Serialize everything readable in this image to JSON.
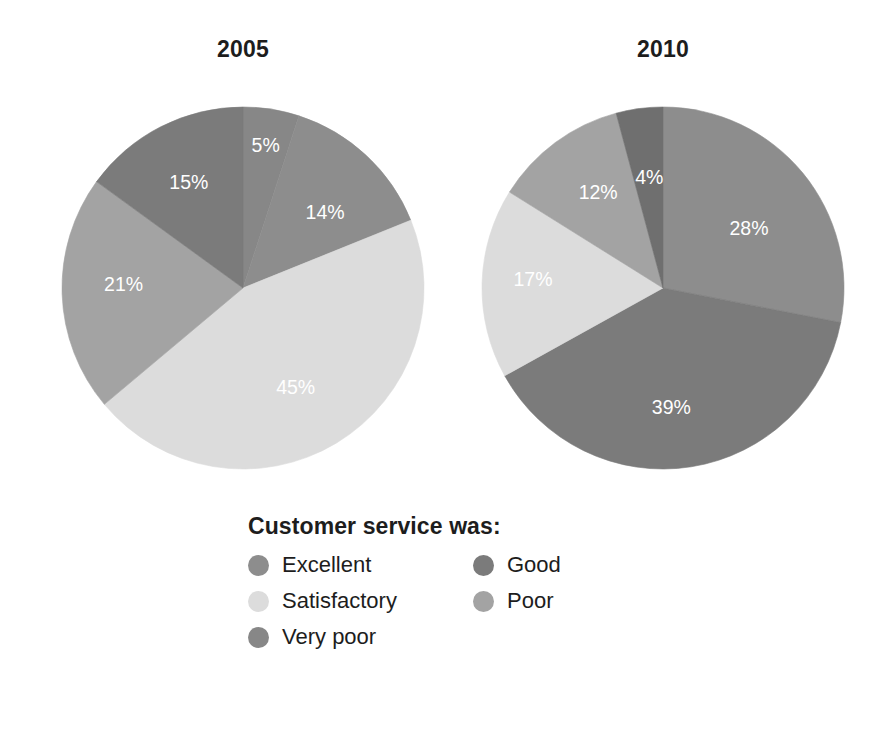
{
  "charts": [
    {
      "title": "2005",
      "labels": [
        "5%",
        "14%",
        "45%",
        "21%",
        "15%"
      ]
    },
    {
      "title": "2010",
      "labels": [
        "28%",
        "39%",
        "17%",
        "12%",
        "4%"
      ]
    }
  ],
  "legend": {
    "title": "Customer service was:",
    "items": [
      {
        "label": "Excellent",
        "color": "#8d8d8d",
        "swatch_name": "legend-swatch-excellent"
      },
      {
        "label": "Good",
        "color": "#7b7b7b",
        "swatch_name": "legend-swatch-good"
      },
      {
        "label": "Satisfactory",
        "color": "#dcdcdc",
        "swatch_name": "legend-swatch-satisfactory"
      },
      {
        "label": "Poor",
        "color": "#a3a3a3",
        "swatch_name": "legend-swatch-poor"
      },
      {
        "label": "Very poor",
        "color": "#878787",
        "swatch_name": "legend-swatch-verypoor"
      }
    ]
  },
  "chart_data": {
    "type": "pie",
    "title": "Customer service was:",
    "categories": [
      "Excellent",
      "Good",
      "Satisfactory",
      "Poor",
      "Very poor"
    ],
    "colors": [
      "#8d8d8d",
      "#7b7b7b",
      "#dcdcdc",
      "#a3a3a3",
      "#878787"
    ],
    "unit": "%",
    "legend_position": "bottom",
    "grid": false,
    "charts": [
      {
        "title": "2005",
        "values": [
          14,
          45,
          21,
          15,
          5
        ],
        "slices": [
          {
            "category": "Very poor",
            "value": 5,
            "label": "5%",
            "color": "#878787",
            "start_deg": 0,
            "end_deg": 18,
            "label_r": 0.8,
            "label_deg": 9
          },
          {
            "category": "Excellent",
            "value": 14,
            "label": "14%",
            "color": "#8d8d8d",
            "start_deg": 18,
            "end_deg": 68,
            "label_r": 0.62,
            "label_deg": 47
          },
          {
            "category": "Satisfactory",
            "value": 45,
            "label": "45%",
            "color": "#dcdcdc",
            "start_deg": 68,
            "end_deg": 230,
            "label_r": 0.62,
            "label_deg": 152
          },
          {
            "category": "Poor",
            "value": 21,
            "label": "21%",
            "color": "#a3a3a3",
            "start_deg": 230,
            "end_deg": 306,
            "label_r": 0.66,
            "label_deg": 272
          },
          {
            "category": "Good",
            "value": 15,
            "label": "15%",
            "color": "#7b7b7b",
            "start_deg": 306,
            "end_deg": 360,
            "label_r": 0.66,
            "label_deg": 333
          }
        ]
      },
      {
        "title": "2010",
        "values": [
          28,
          39,
          17,
          12,
          4
        ],
        "slices": [
          {
            "category": "Excellent",
            "value": 28,
            "label": "28%",
            "color": "#8d8d8d",
            "start_deg": 0,
            "end_deg": 101,
            "label_r": 0.58,
            "label_deg": 55
          },
          {
            "category": "Good",
            "value": 39,
            "label": "39%",
            "color": "#7b7b7b",
            "start_deg": 101,
            "end_deg": 241,
            "label_r": 0.66,
            "label_deg": 176
          },
          {
            "category": "Satisfactory",
            "value": 17,
            "label": "17%",
            "color": "#dcdcdc",
            "start_deg": 241,
            "end_deg": 302,
            "label_r": 0.72,
            "label_deg": 274
          },
          {
            "category": "Poor",
            "value": 12,
            "label": "12%",
            "color": "#a3a3a3",
            "start_deg": 302,
            "end_deg": 345,
            "label_r": 0.64,
            "label_deg": 326
          },
          {
            "category": "Very poor",
            "value": 4,
            "label": "4%",
            "color": "#6f6f6f",
            "start_deg": 345,
            "end_deg": 360,
            "label_r": 0.62,
            "label_deg": 353
          }
        ]
      }
    ]
  }
}
